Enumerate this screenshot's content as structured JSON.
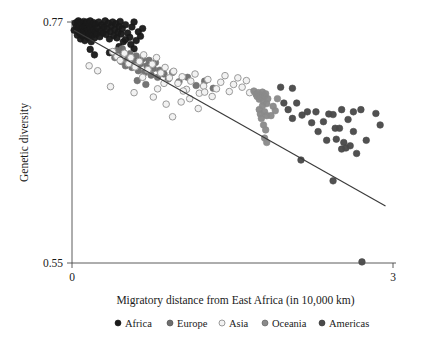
{
  "chart_data": {
    "type": "scatter",
    "title": "",
    "subtitle": "",
    "xlabel": "Migratory distance from East Africa (in 10,000 km)",
    "ylabel": "Genetic diversity",
    "xlim": [
      0,
      3
    ],
    "ylim": [
      0.55,
      0.77
    ],
    "xticks": [
      "0",
      "3"
    ],
    "xtick_values": [
      0,
      3
    ],
    "yticks": [
      "0.77",
      "0.55"
    ],
    "ytick_values": [
      0.77,
      0.55
    ],
    "grid": false,
    "legend_position": "bottom",
    "legend": [
      {
        "name": "Africa",
        "marker": "filled-circle",
        "color": "#1a1a1a",
        "edge": "#1a1a1a"
      },
      {
        "name": "Europe",
        "marker": "filled-circle",
        "color": "#6e6e6e",
        "edge": "#4a4a4a"
      },
      {
        "name": "Asia",
        "marker": "open-circle",
        "color": "#f2f2f2",
        "edge": "#9a9a9a"
      },
      {
        "name": "Oceania",
        "marker": "filled-circle",
        "color": "#8a8a8a",
        "edge": "#5a5a5a"
      },
      {
        "name": "Americas",
        "marker": "filled-circle",
        "color": "#4a4a4a",
        "edge": "#333333"
      }
    ],
    "fit_line": {
      "name": "linear fit",
      "x": [
        0.02,
        2.93
      ],
      "y": [
        0.7625,
        0.602
      ],
      "color": "#3a3a3a"
    },
    "series": [
      {
        "name": "Africa",
        "color": "#1a1a1a",
        "marker": "filled-circle",
        "points": [
          [
            0.02,
            0.7625
          ],
          [
            0.03,
            0.769
          ],
          [
            0.04,
            0.7655
          ],
          [
            0.05,
            0.77
          ],
          [
            0.05,
            0.758
          ],
          [
            0.06,
            0.764
          ],
          [
            0.06,
            0.771
          ],
          [
            0.07,
            0.76
          ],
          [
            0.07,
            0.767
          ],
          [
            0.08,
            0.7545
          ],
          [
            0.08,
            0.7695
          ],
          [
            0.09,
            0.762
          ],
          [
            0.09,
            0.768
          ],
          [
            0.1,
            0.7575
          ],
          [
            0.1,
            0.765
          ],
          [
            0.11,
            0.7705
          ],
          [
            0.11,
            0.761
          ],
          [
            0.12,
            0.766
          ],
          [
            0.12,
            0.753
          ],
          [
            0.13,
            0.769
          ],
          [
            0.13,
            0.7595
          ],
          [
            0.14,
            0.7645
          ],
          [
            0.14,
            0.77
          ],
          [
            0.15,
            0.756
          ],
          [
            0.15,
            0.7625
          ],
          [
            0.16,
            0.7675
          ],
          [
            0.16,
            0.759
          ],
          [
            0.17,
            0.764
          ],
          [
            0.17,
            0.771
          ],
          [
            0.18,
            0.752
          ],
          [
            0.18,
            0.7605
          ],
          [
            0.19,
            0.7665
          ],
          [
            0.19,
            0.758
          ],
          [
            0.2,
            0.763
          ],
          [
            0.2,
            0.7695
          ],
          [
            0.21,
            0.7555
          ],
          [
            0.22,
            0.7615
          ],
          [
            0.22,
            0.768
          ],
          [
            0.23,
            0.759
          ],
          [
            0.24,
            0.7645
          ],
          [
            0.25,
            0.77
          ],
          [
            0.26,
            0.7565
          ],
          [
            0.27,
            0.762
          ],
          [
            0.28,
            0.7675
          ],
          [
            0.29,
            0.76
          ],
          [
            0.3,
            0.7655
          ],
          [
            0.31,
            0.771
          ],
          [
            0.32,
            0.7585
          ],
          [
            0.33,
            0.7635
          ],
          [
            0.34,
            0.769
          ],
          [
            0.35,
            0.7545
          ],
          [
            0.36,
            0.761
          ],
          [
            0.37,
            0.7665
          ],
          [
            0.38,
            0.77
          ],
          [
            0.39,
            0.7575
          ],
          [
            0.4,
            0.763
          ],
          [
            0.41,
            0.7685
          ],
          [
            0.42,
            0.7555
          ],
          [
            0.43,
            0.7605
          ],
          [
            0.44,
            0.766
          ],
          [
            0.45,
            0.7705
          ],
          [
            0.46,
            0.759
          ],
          [
            0.47,
            0.764
          ],
          [
            0.48,
            0.752
          ],
          [
            0.5,
            0.7675
          ],
          [
            0.52,
            0.76
          ],
          [
            0.54,
            0.756
          ],
          [
            0.56,
            0.7655
          ],
          [
            0.58,
            0.77
          ],
          [
            0.6,
            0.753
          ],
          [
            0.62,
            0.761
          ],
          [
            0.64,
            0.757
          ],
          [
            0.66,
            0.764
          ],
          [
            0.17,
            0.745
          ],
          [
            0.21,
            0.74
          ],
          [
            0.55,
            0.7495
          ],
          [
            0.44,
            0.7475
          ],
          [
            0.35,
            0.742
          ],
          [
            0.5,
            0.754
          ],
          [
            0.58,
            0.7455
          ]
        ]
      },
      {
        "name": "Europe",
        "color": "#6e6e6e",
        "marker": "filled-circle",
        "points": [
          [
            0.4,
            0.7375
          ],
          [
            0.44,
            0.7395
          ],
          [
            0.46,
            0.734
          ],
          [
            0.48,
            0.742
          ],
          [
            0.5,
            0.73
          ],
          [
            0.52,
            0.736
          ],
          [
            0.54,
            0.741
          ],
          [
            0.56,
            0.7285
          ],
          [
            0.58,
            0.7345
          ],
          [
            0.6,
            0.739
          ],
          [
            0.62,
            0.7255
          ],
          [
            0.64,
            0.732
          ],
          [
            0.66,
            0.7365
          ],
          [
            0.68,
            0.724
          ],
          [
            0.7,
            0.73
          ],
          [
            0.72,
            0.735
          ],
          [
            0.74,
            0.7215
          ],
          [
            0.76,
            0.7275
          ],
          [
            0.78,
            0.733
          ],
          [
            0.8,
            0.7195
          ],
          [
            0.82,
            0.726
          ],
          [
            0.86,
            0.7225
          ],
          [
            0.9,
            0.718
          ],
          [
            0.94,
            0.724
          ],
          [
            1.0,
            0.7155
          ],
          [
            1.08,
            0.7195
          ],
          [
            1.16,
            0.712
          ],
          [
            1.24,
            0.716
          ],
          [
            1.32,
            0.7095
          ],
          [
            0.42,
            0.744
          ],
          [
            0.47,
            0.7455
          ],
          [
            0.61,
            0.7165
          ],
          [
            0.69,
            0.713
          ]
        ]
      },
      {
        "name": "Asia",
        "color": "#f2f2f2",
        "edge": "#9a9a9a",
        "marker": "open-circle",
        "points": [
          [
            0.16,
            0.73
          ],
          [
            0.24,
            0.7255
          ],
          [
            0.38,
            0.743
          ],
          [
            0.42,
            0.7385
          ],
          [
            0.45,
            0.735
          ],
          [
            0.49,
            0.7415
          ],
          [
            0.53,
            0.732
          ],
          [
            0.55,
            0.7375
          ],
          [
            0.59,
            0.729
          ],
          [
            0.63,
            0.734
          ],
          [
            0.67,
            0.74
          ],
          [
            0.71,
            0.7265
          ],
          [
            0.75,
            0.7315
          ],
          [
            0.79,
            0.7375
          ],
          [
            0.83,
            0.7235
          ],
          [
            0.87,
            0.7285
          ],
          [
            0.91,
            0.719
          ],
          [
            0.95,
            0.725
          ],
          [
            0.99,
            0.714
          ],
          [
            1.03,
            0.72
          ],
          [
            1.07,
            0.7085
          ],
          [
            1.11,
            0.716
          ],
          [
            1.15,
            0.7225
          ],
          [
            1.19,
            0.705
          ],
          [
            1.23,
            0.7115
          ],
          [
            1.27,
            0.7175
          ],
          [
            1.31,
            0.702
          ],
          [
            1.35,
            0.709
          ],
          [
            1.39,
            0.715
          ],
          [
            1.43,
            0.721
          ],
          [
            1.47,
            0.7065
          ],
          [
            1.51,
            0.713
          ],
          [
            1.55,
            0.719
          ],
          [
            1.59,
            0.7105
          ],
          [
            1.63,
            0.7165
          ],
          [
            0.36,
            0.711
          ],
          [
            0.58,
            0.7055
          ],
          [
            0.76,
            0.7015
          ],
          [
            0.88,
            0.695
          ],
          [
            1.02,
            0.697
          ],
          [
            0.94,
            0.6835
          ],
          [
            1.1,
            0.7
          ],
          [
            1.18,
            0.691
          ],
          [
            0.8,
            0.709
          ],
          [
            0.86,
            0.714
          ],
          [
            1.04,
            0.707
          ],
          [
            1.24,
            0.706
          ],
          [
            0.66,
            0.7195
          ],
          [
            1.66,
            0.7055
          ]
        ]
      },
      {
        "name": "Oceania",
        "color": "#8a8a8a",
        "marker": "filled-circle",
        "points": [
          [
            1.7,
            0.707
          ],
          [
            1.72,
            0.704
          ],
          [
            1.73,
            0.702
          ],
          [
            1.74,
            0.7055
          ],
          [
            1.75,
            0.6995
          ],
          [
            1.76,
            0.7035
          ],
          [
            1.77,
            0.701
          ],
          [
            1.78,
            0.706
          ],
          [
            1.79,
            0.6975
          ],
          [
            1.8,
            0.7025
          ],
          [
            1.81,
            0.7045
          ],
          [
            1.82,
            0.6955
          ],
          [
            1.83,
            0.7
          ],
          [
            1.75,
            0.69
          ],
          [
            1.76,
            0.686
          ],
          [
            1.77,
            0.682
          ],
          [
            1.78,
            0.6935
          ],
          [
            1.8,
            0.688
          ],
          [
            1.82,
            0.6845
          ],
          [
            1.79,
            0.676
          ],
          [
            1.81,
            0.6715
          ],
          [
            1.8,
            0.664
          ],
          [
            1.82,
            0.66
          ],
          [
            1.88,
            0.693
          ],
          [
            1.9,
            0.689
          ],
          [
            1.92,
            0.7
          ],
          [
            1.86,
            0.6845
          ]
        ]
      },
      {
        "name": "Americas",
        "color": "#4a4a4a",
        "marker": "filled-circle",
        "points": [
          [
            1.95,
            0.7105
          ],
          [
            2.06,
            0.7095
          ],
          [
            2.1,
            0.696
          ],
          [
            2.02,
            0.69
          ],
          [
            2.15,
            0.685
          ],
          [
            2.28,
            0.688
          ],
          [
            2.35,
            0.679
          ],
          [
            2.4,
            0.686
          ],
          [
            2.44,
            0.6855
          ],
          [
            2.52,
            0.69
          ],
          [
            2.58,
            0.681
          ],
          [
            2.63,
            0.688
          ],
          [
            2.7,
            0.69
          ],
          [
            2.84,
            0.6865
          ],
          [
            2.3,
            0.67
          ],
          [
            2.46,
            0.673
          ],
          [
            2.5,
            0.673
          ],
          [
            2.63,
            0.67
          ],
          [
            2.38,
            0.662
          ],
          [
            2.47,
            0.663
          ],
          [
            2.54,
            0.66
          ],
          [
            2.52,
            0.654
          ],
          [
            2.56,
            0.655
          ],
          [
            2.6,
            0.657
          ],
          [
            2.66,
            0.65
          ],
          [
            2.14,
            0.644
          ],
          [
            2.44,
            0.625
          ],
          [
            2.71,
            0.551
          ],
          [
            2.2,
            0.688
          ],
          [
            1.98,
            0.696
          ],
          [
            2.06,
            0.682
          ],
          [
            2.24,
            0.678
          ],
          [
            2.75,
            0.662
          ],
          [
            2.88,
            0.676
          ]
        ]
      }
    ]
  },
  "axes": {
    "y_top_label": "0.77",
    "y_bottom_label": "0.55",
    "x_left_label": "0",
    "x_right_label": "3",
    "y_title": "Genetic diversity",
    "x_title": "Migratory distance from East Africa (in 10,000 km)"
  },
  "legend": {
    "items": [
      {
        "label": "Africa"
      },
      {
        "label": "Europe"
      },
      {
        "label": "Asia"
      },
      {
        "label": "Oceania"
      },
      {
        "label": "Americas"
      }
    ]
  }
}
